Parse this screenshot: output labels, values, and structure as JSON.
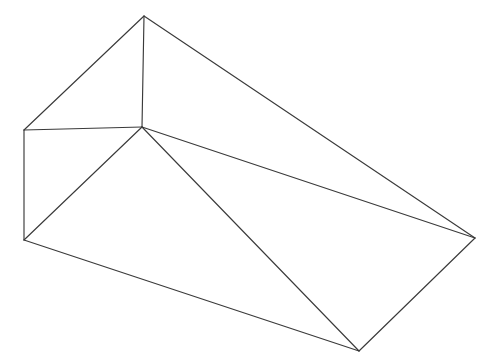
{
  "figure": {
    "kind": "3d-wireframe-line-drawing",
    "subject_label": "wedge-prism-wireframe",
    "canvas": {
      "width": 487,
      "height": 360,
      "background": "#ffffff"
    },
    "style": {
      "stroke_color": "#3a3a3a",
      "stroke_width": 1.15,
      "fill": "none"
    },
    "vertices": {
      "apex_top": {
        "name": "apex-top",
        "x": 144,
        "y": 16
      },
      "left_upper": {
        "name": "left-upper",
        "x": 24,
        "y": 130
      },
      "left_lower": {
        "name": "left-lower",
        "x": 24,
        "y": 240
      },
      "inner_bottom": {
        "name": "inner-bottom",
        "x": 142,
        "y": 127
      },
      "right_far": {
        "name": "right-far",
        "x": 475,
        "y": 238
      },
      "bottom_far": {
        "name": "bottom-far",
        "x": 359,
        "y": 351
      }
    },
    "edges": [
      {
        "name": "edge-apex-to-left-upper",
        "from": "apex_top",
        "to": "left_upper"
      },
      {
        "name": "edge-apex-to-inner-bottom",
        "from": "apex_top",
        "to": "inner_bottom"
      },
      {
        "name": "edge-apex-to-right-far",
        "from": "apex_top",
        "to": "right_far"
      },
      {
        "name": "edge-left-upper-to-inner",
        "from": "left_upper",
        "to": "inner_bottom"
      },
      {
        "name": "edge-left-upper-to-left-lower",
        "from": "left_upper",
        "to": "left_lower"
      },
      {
        "name": "edge-left-lower-to-inner",
        "from": "left_lower",
        "to": "inner_bottom"
      },
      {
        "name": "edge-left-lower-to-bottom-far",
        "from": "left_lower",
        "to": "bottom_far"
      },
      {
        "name": "edge-inner-to-right-far",
        "from": "inner_bottom",
        "to": "right_far"
      },
      {
        "name": "edge-inner-to-bottom-far",
        "from": "inner_bottom",
        "to": "bottom_far"
      },
      {
        "name": "edge-right-far-to-bottom-far",
        "from": "right_far",
        "to": "bottom_far"
      }
    ],
    "crossings": [
      {
        "name": "edge-crossing-left-face",
        "x": 92,
        "y": 174
      }
    ]
  }
}
